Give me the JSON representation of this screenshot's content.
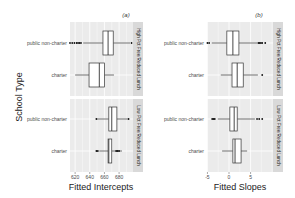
{
  "figure": {
    "y_axis_title": "School Type",
    "panels": [
      {
        "tag": "(a)",
        "x_axis_title": "Fitted Intercepts",
        "ticks": [
          "620",
          "640",
          "660",
          "680"
        ]
      },
      {
        "tag": "(b)",
        "x_axis_title": "Fitted Slopes",
        "ticks": [
          "-5",
          "0",
          "5"
        ]
      }
    ],
    "facets": [
      "High Pct Free/Reduced Lunch",
      "Low Pct Free/Reduced Lunch"
    ],
    "categories": [
      "public non-charter",
      "charter"
    ]
  },
  "chart_data": [
    {
      "type": "boxplot",
      "title": "(a)",
      "xlabel": "Fitted Intercepts",
      "ylabel": "School Type",
      "xlim": [
        613,
        699
      ],
      "xticks": [
        620,
        640,
        660,
        680
      ],
      "grid": true,
      "orientation": "horizontal",
      "facets": [
        {
          "label": "High Pct Free/Reduced Lunch",
          "boxes": [
            {
              "category": "public non-charter",
              "whisker_low": 631,
              "q1": 658,
              "median": 665,
              "q3": 672,
              "whisker_high": 695,
              "outliers": [
                613,
                616,
                619,
                622,
                624,
                626,
                628,
                697
              ]
            },
            {
              "category": "charter",
              "whisker_low": 620,
              "q1": 639,
              "median": 653,
              "q3": 660,
              "whisker_high": 673,
              "outliers": []
            }
          ]
        },
        {
          "label": "Low Pct Free/Reduced Lunch",
          "boxes": [
            {
              "category": "public non-charter",
              "whisker_low": 650,
              "q1": 666,
              "median": 670,
              "q3": 677,
              "whisker_high": 692,
              "outliers": [
                649,
                693
              ]
            },
            {
              "category": "charter",
              "whisker_low": 653,
              "q1": 665,
              "median": 666,
              "q3": 670,
              "whisker_high": 684,
              "outliers": [
                649,
                651,
                676,
                678,
                680
              ]
            }
          ]
        }
      ]
    },
    {
      "type": "boxplot",
      "title": "(b)",
      "xlabel": "Fitted Slopes",
      "ylabel": "School Type",
      "xlim": [
        -5.1,
        10.2
      ],
      "xticks": [
        -5,
        0,
        5
      ],
      "grid": true,
      "orientation": "horizontal",
      "facets": [
        {
          "label": "High Pct Free/Reduced Lunch",
          "boxes": [
            {
              "category": "public non-charter",
              "whisker_low": -4.0,
              "q1": -0.5,
              "median": 0.9,
              "q3": 2.3,
              "whisker_high": 6.5,
              "outliers": [
                -5.0,
                -4.6,
                6.8,
                7.1,
                7.4,
                7.7,
                8.4
              ]
            },
            {
              "category": "charter",
              "whisker_low": -1.9,
              "q1": 0.7,
              "median": 1.9,
              "q3": 3.3,
              "whisker_high": 6.7,
              "outliers": [
                7.7
              ]
            }
          ]
        },
        {
          "label": "Low Pct Free/Reduced Lunch",
          "boxes": [
            {
              "category": "public non-charter",
              "whisker_low": -2.6,
              "q1": 0.2,
              "median": 1.2,
              "q3": 1.9,
              "whisker_high": 6.0,
              "outliers": [
                -3.9,
                -3.6,
                -3.3,
                6.5,
                7.0,
                7.7
              ]
            },
            {
              "category": "charter",
              "whisker_low": -1.6,
              "q1": 0.9,
              "median": 1.4,
              "q3": 2.8,
              "whisker_high": 4.2,
              "outliers": []
            }
          ]
        }
      ]
    }
  ]
}
